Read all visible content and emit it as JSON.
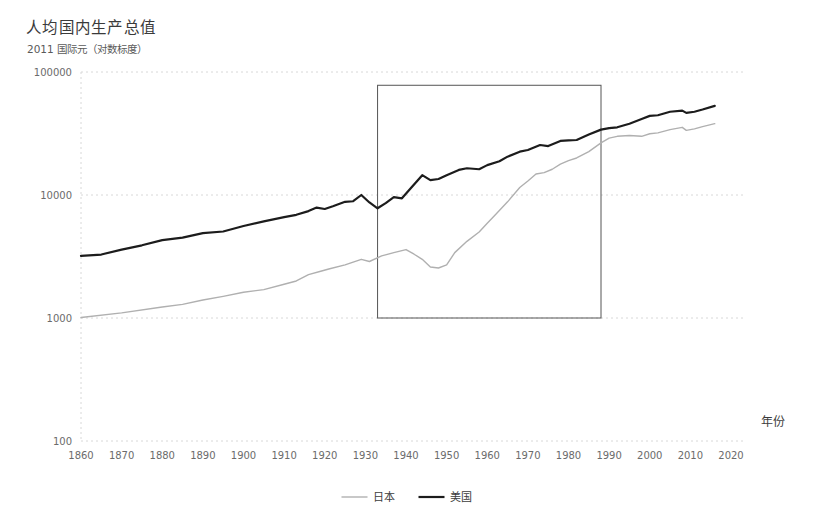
{
  "chart_data": {
    "type": "line",
    "title": "人均国内生产总值",
    "subtitle": "2011 国际元（对数标度）",
    "xlabel": "年份",
    "ylabel": "",
    "yscale": "log",
    "ylim": [
      100,
      100000
    ],
    "xlim": [
      1860,
      2020
    ],
    "grid": true,
    "legend_position": "bottom",
    "y_ticks": [
      "100000",
      "10000",
      "1000",
      "100"
    ],
    "y_tick_values": [
      100000,
      10000,
      1000,
      100
    ],
    "x_ticks": [
      "1860",
      "1870",
      "1880",
      "1890",
      "1900",
      "1910",
      "1920",
      "1930",
      "1940",
      "1950",
      "1960",
      "1970",
      "1980",
      "1990",
      "2000",
      "2010",
      "2020"
    ],
    "x_tick_values": [
      1860,
      1870,
      1880,
      1890,
      1900,
      1910,
      1920,
      1930,
      1940,
      1950,
      1960,
      1970,
      1980,
      1990,
      2000,
      2010,
      2020
    ],
    "annotations": [
      {
        "name": "highlight-rectangle",
        "type": "rect",
        "x0": 1933,
        "x1": 1988,
        "y0": 1000,
        "y1": 78000,
        "stroke": "#555555",
        "fill": "none"
      }
    ],
    "series": [
      {
        "name": "日本",
        "color": "#b0b0b0",
        "width": 1.4,
        "x": [
          1860,
          1870,
          1880,
          1885,
          1890,
          1895,
          1900,
          1905,
          1910,
          1913,
          1916,
          1919,
          1921,
          1925,
          1929,
          1931,
          1934,
          1937,
          1940,
          1942,
          1944,
          1946,
          1948,
          1950,
          1952,
          1955,
          1958,
          1960,
          1962,
          1965,
          1968,
          1970,
          1972,
          1974,
          1976,
          1978,
          1980,
          1982,
          1985,
          1988,
          1990,
          1992,
          1995,
          1998,
          2000,
          2002,
          2005,
          2008,
          2009,
          2011,
          2013,
          2016
        ],
        "y": [
          1010,
          1100,
          1230,
          1290,
          1400,
          1500,
          1620,
          1700,
          1880,
          2000,
          2250,
          2400,
          2500,
          2700,
          3000,
          2880,
          3200,
          3400,
          3600,
          3300,
          3000,
          2600,
          2550,
          2700,
          3400,
          4200,
          5000,
          5900,
          6900,
          8800,
          11500,
          13000,
          14800,
          15200,
          16200,
          17800,
          19000,
          20000,
          22500,
          26500,
          29000,
          30000,
          30500,
          30000,
          31500,
          32000,
          34000,
          35500,
          33500,
          34500,
          36000,
          38000
        ]
      },
      {
        "name": "美国",
        "color": "#1c1c1c",
        "width": 2.2,
        "x": [
          1860,
          1865,
          1870,
          1875,
          1880,
          1885,
          1890,
          1895,
          1900,
          1905,
          1910,
          1913,
          1916,
          1918,
          1920,
          1922,
          1925,
          1927,
          1929,
          1931,
          1933,
          1935,
          1937,
          1939,
          1941,
          1944,
          1946,
          1948,
          1950,
          1953,
          1955,
          1958,
          1960,
          1963,
          1965,
          1968,
          1970,
          1973,
          1975,
          1978,
          1980,
          1982,
          1985,
          1988,
          1990,
          1992,
          1995,
          1998,
          2000,
          2002,
          2005,
          2008,
          2009,
          2011,
          2013,
          2016
        ],
        "y": [
          3200,
          3280,
          3600,
          3900,
          4300,
          4500,
          4900,
          5050,
          5600,
          6100,
          6600,
          6900,
          7400,
          7900,
          7700,
          8100,
          8800,
          8900,
          10000,
          8700,
          7800,
          8600,
          9600,
          9400,
          11200,
          14500,
          13200,
          13500,
          14500,
          16000,
          16500,
          16200,
          17500,
          18800,
          20500,
          22500,
          23200,
          25500,
          25000,
          27500,
          27800,
          28000,
          31000,
          34000,
          35000,
          35500,
          38000,
          41500,
          44000,
          44500,
          47500,
          48500,
          46500,
          47500,
          49500,
          53000
        ]
      }
    ]
  },
  "legend": {
    "items": [
      {
        "label": "日本",
        "color": "#b0b0b0"
      },
      {
        "label": "美国",
        "color": "#1c1c1c"
      }
    ]
  }
}
